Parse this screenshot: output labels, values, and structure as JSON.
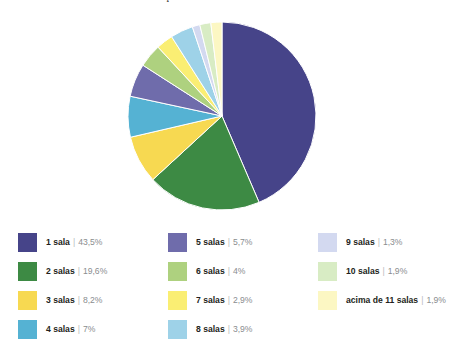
{
  "title": {
    "text": "Gráfico 3: Total de salas/habitação – 2006"
  },
  "chart_data": {
    "type": "pie",
    "title": "Gráfico 3: Total de salas/habitação – 2006",
    "xlabel": "",
    "ylabel": "",
    "legend_position": "bottom",
    "grid": false,
    "value_suffix": "%",
    "decimal_separator": ",",
    "start_angle_deg": 0,
    "direction": "clockwise",
    "slices": [
      {
        "label": "1 sala",
        "value": 43.5,
        "value_text": "43,5%",
        "color": "#464489"
      },
      {
        "label": "2 salas",
        "value": 19.6,
        "value_text": "19,6%",
        "color": "#3d8a44"
      },
      {
        "label": "3 salas",
        "value": 8.2,
        "value_text": "8,2%",
        "color": "#f7d951"
      },
      {
        "label": "4 salas",
        "value": 7.0,
        "value_text": "7%",
        "color": "#55b2d3"
      },
      {
        "label": "5 salas",
        "value": 5.7,
        "value_text": "5,7%",
        "color": "#6f6cab"
      },
      {
        "label": "6 salas",
        "value": 4.0,
        "value_text": "4%",
        "color": "#aed17f"
      },
      {
        "label": "7 salas",
        "value": 2.9,
        "value_text": "2,9%",
        "color": "#faee73"
      },
      {
        "label": "8 salas",
        "value": 3.9,
        "value_text": "3,9%",
        "color": "#9ed2e8"
      },
      {
        "label": "9 salas",
        "value": 1.3,
        "value_text": "1,3%",
        "color": "#d3d9f0"
      },
      {
        "label": "10 salas",
        "value": 1.9,
        "value_text": "1,9%",
        "color": "#d8ecc4"
      },
      {
        "label": "acima de 11 salas",
        "value": 1.9,
        "value_text": "1,9%",
        "color": "#fcf7c3"
      }
    ]
  },
  "legend": {
    "columns": [
      {
        "items": [
          {
            "label": "1 sala",
            "separator": "|",
            "value_text": "43,5%",
            "color": "#464489"
          },
          {
            "label": "2 salas",
            "separator": "|",
            "value_text": "19,6%",
            "color": "#3d8a44"
          },
          {
            "label": "3 salas",
            "separator": "|",
            "value_text": "8,2%",
            "color": "#f7d951"
          },
          {
            "label": "4 salas",
            "separator": "|",
            "value_text": "7%",
            "color": "#55b2d3"
          }
        ]
      },
      {
        "items": [
          {
            "label": "5 salas",
            "separator": "|",
            "value_text": "5,7%",
            "color": "#6f6cab"
          },
          {
            "label": "6 salas",
            "separator": "|",
            "value_text": "4%",
            "color": "#aed17f"
          },
          {
            "label": "7 salas",
            "separator": "|",
            "value_text": "2,9%",
            "color": "#faee73"
          },
          {
            "label": "8 salas",
            "separator": "|",
            "value_text": "3,9%",
            "color": "#9ed2e8"
          }
        ]
      },
      {
        "items": [
          {
            "label": "9 salas",
            "separator": "|",
            "value_text": "1,3%",
            "color": "#d3d9f0"
          },
          {
            "label": "10 salas",
            "separator": "|",
            "value_text": "1,9%",
            "color": "#d8ecc4"
          },
          {
            "label": "acima de 11 salas",
            "separator": "|",
            "value_text": "1,9%",
            "color": "#fcf7c3"
          }
        ]
      }
    ]
  },
  "geometry": {
    "center_x": 222,
    "center_y": 116,
    "radius": 94
  }
}
